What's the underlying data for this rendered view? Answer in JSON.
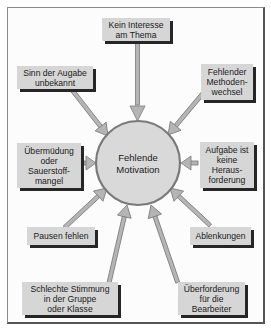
{
  "diagram": {
    "type": "cause-diagram",
    "center": {
      "label": "Fehlende\nMotivation"
    },
    "causes": [
      {
        "id": "kein-interesse",
        "label": "Kein Interesse\nam Thema"
      },
      {
        "id": "sinn-unbekannt",
        "label": "Sinn der Augabe\nunbekannt"
      },
      {
        "id": "methodenwechsel",
        "label": "Fehlender\nMethoden-\nwechsel"
      },
      {
        "id": "uebermuedung",
        "label": "Übermüdung\noder\nSauerstoff-\nmangel"
      },
      {
        "id": "keine-herausforderung",
        "label": "Aufgabe ist\nkeine\nHeraus-\nforderung"
      },
      {
        "id": "pausen",
        "label": "Pausen fehlen"
      },
      {
        "id": "ablenkungen",
        "label": "Ablenkungen"
      },
      {
        "id": "schlechte-stimmung",
        "label": "Schlechte Stimmung\nin der Gruppe\noder Klasse"
      },
      {
        "id": "ueberforderung",
        "label": "Überforderung\nfür die\nBearbeiter"
      }
    ],
    "colors": {
      "box_fill": "#d6d6d6",
      "box_shadow": "#262626",
      "circle_fill": "#d9d9d9",
      "circle_stroke": "#7a7a7a",
      "arrow_fill": "#b5b5b5",
      "arrow_stroke": "#7a7a7a"
    }
  }
}
